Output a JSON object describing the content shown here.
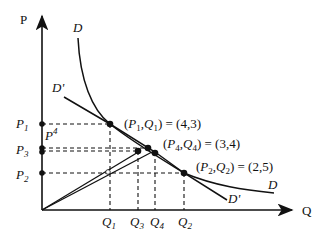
{
  "axes": {
    "y_label": "P",
    "x_label": "Q"
  },
  "curves": {
    "demand": {
      "label": "D"
    },
    "demand_prime": {
      "label": "D'"
    }
  },
  "price_levels": [
    {
      "name": "P",
      "sub": "1"
    },
    {
      "name": "P",
      "sub": "4"
    },
    {
      "name": "P",
      "sub": "3"
    },
    {
      "name": "P",
      "sub": "2"
    }
  ],
  "quantity_levels": [
    {
      "name": "Q",
      "sub": "1"
    },
    {
      "name": "Q",
      "sub": "3"
    },
    {
      "name": "Q",
      "sub": "4"
    },
    {
      "name": "Q",
      "sub": "2"
    }
  ],
  "annotations": {
    "point1": {
      "p": "P",
      "psub": "1",
      "q": "Q",
      "qsub": "1",
      "value": "= (4,3)"
    },
    "point4": {
      "p": "P",
      "psub": "4",
      "q": "Q",
      "qsub": "4",
      "value": "= (3,4)"
    },
    "point2": {
      "p": "P",
      "psub": "2",
      "q": "Q",
      "qsub": "2",
      "value": "= (2,5)"
    }
  },
  "colors": {
    "ink": "#111111",
    "background": "#ffffff"
  }
}
